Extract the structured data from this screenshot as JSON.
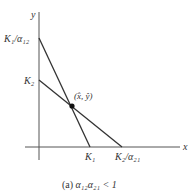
{
  "figure": {
    "caption_prefix": "(a) ",
    "caption_math": "α₁₂α₂₁ < 1",
    "axes": {
      "x_label": "x",
      "y_label": "y"
    },
    "intercepts": {
      "y_upper": "K₁/α₁₂",
      "y_lower": "K₂",
      "x_left": "K₁",
      "x_right": "K₂/α₂₁"
    },
    "equilibrium_label": "(x̂, ŷ)",
    "line_color": "#333333",
    "axis_color": "#555555"
  }
}
